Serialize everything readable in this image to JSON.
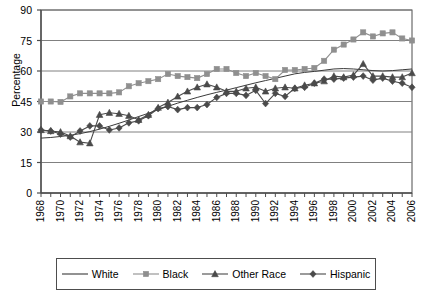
{
  "chart_data": {
    "type": "line",
    "title": "",
    "xlabel": "",
    "ylabel": "Percentage",
    "ylim": [
      0,
      90
    ],
    "yticks": [
      0,
      15,
      30,
      45,
      60,
      75,
      90
    ],
    "grid": true,
    "legend_position": "bottom",
    "x": [
      1968,
      1969,
      1970,
      1971,
      1972,
      1973,
      1974,
      1975,
      1976,
      1977,
      1978,
      1979,
      1980,
      1981,
      1982,
      1983,
      1984,
      1985,
      1986,
      1987,
      1988,
      1989,
      1990,
      1991,
      1992,
      1993,
      1994,
      1995,
      1996,
      1997,
      1998,
      1999,
      2000,
      2001,
      2002,
      2003,
      2004,
      2005,
      2006
    ],
    "xtick_labels": [
      "1968",
      "1970",
      "1972",
      "1974",
      "1976",
      "1978",
      "1980",
      "1982",
      "1984",
      "1986",
      "1988",
      "1990",
      "1992",
      "1994",
      "1996",
      "1998",
      "2000",
      "2002",
      "2004",
      "2006"
    ],
    "xtick_step_years": 2,
    "xlim": [
      1968,
      2006
    ],
    "series": [
      {
        "name": "White",
        "marker": "none",
        "color": "#3a3a3a",
        "values": [
          27.0,
          27.3,
          27.8,
          28.4,
          29.2,
          30.2,
          31.4,
          32.8,
          34.3,
          35.9,
          37.6,
          39.2,
          41.0,
          42.6,
          44.2,
          45.6,
          47.0,
          48.3,
          49.5,
          50.6,
          51.8,
          53.0,
          54.2,
          55.3,
          56.4,
          57.5,
          58.6,
          59.3,
          59.8,
          60.4,
          61.0,
          61.2,
          61.0,
          60.6,
          60.2,
          60.0,
          60.2,
          60.6,
          61.0
        ]
      },
      {
        "name": "Black",
        "marker": "square",
        "color": "#8f8f8f",
        "values": [
          45.0,
          45.0,
          44.8,
          47.5,
          49.0,
          49.0,
          49.0,
          49.0,
          49.5,
          52.5,
          54.0,
          55.0,
          56.0,
          58.5,
          57.5,
          57.0,
          56.5,
          58.5,
          61.0,
          61.0,
          59.0,
          57.5,
          59.0,
          57.5,
          56.0,
          60.5,
          60.5,
          61.0,
          61.5,
          65.0,
          70.5,
          73.0,
          75.5,
          79.0,
          77.0,
          78.5,
          79.0,
          76.0,
          75.0
        ]
      },
      {
        "name": "Other Race",
        "marker": "triangle",
        "color": "#4a4a4a",
        "values": [
          31.0,
          30.5,
          30.0,
          28.0,
          25.0,
          24.5,
          38.5,
          39.5,
          39.0,
          38.0,
          36.0,
          38.5,
          42.0,
          44.5,
          47.5,
          50.0,
          52.0,
          53.5,
          52.0,
          50.0,
          50.0,
          51.5,
          52.0,
          50.0,
          51.5,
          52.0,
          51.5,
          53.0,
          54.0,
          55.0,
          57.5,
          57.0,
          58.0,
          63.5,
          57.5,
          57.5,
          57.0,
          57.0,
          59.0
        ]
      },
      {
        "name": "Hispanic",
        "marker": "diamond",
        "color": "#4a4a4a",
        "values": [
          31.0,
          30.5,
          29.0,
          27.5,
          30.5,
          33.0,
          33.0,
          31.0,
          32.0,
          34.5,
          35.5,
          38.0,
          41.5,
          42.5,
          41.0,
          42.0,
          42.0,
          43.5,
          47.0,
          49.0,
          49.0,
          48.0,
          50.5,
          44.0,
          49.0,
          47.5,
          51.5,
          52.0,
          54.0,
          56.0,
          56.0,
          56.5,
          57.0,
          57.5,
          55.5,
          56.5,
          55.0,
          54.0,
          52.0
        ]
      }
    ]
  },
  "legend": {
    "items": [
      {
        "label": "White",
        "marker": "none"
      },
      {
        "label": "Black",
        "marker": "square"
      },
      {
        "label": "Other Race",
        "marker": "triangle"
      },
      {
        "label": "Hispanic",
        "marker": "diamond"
      }
    ]
  },
  "axis": {
    "y_title": "Percentage"
  },
  "colors": {
    "axis": "#4d4d4d",
    "grid": "#808080",
    "white_series": "#3a3a3a",
    "black_series": "#8f8f8f",
    "other_race_series": "#4a4a4a",
    "hispanic_series": "#4a4a4a",
    "text": "#000000"
  }
}
